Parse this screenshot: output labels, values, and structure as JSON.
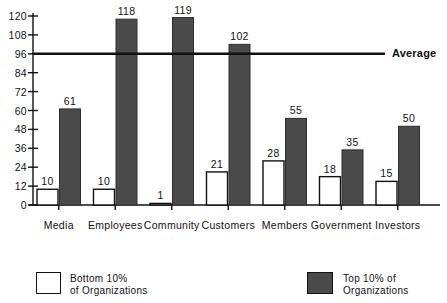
{
  "chart_data": {
    "type": "bar",
    "title": "",
    "subtitle": "",
    "xlabel": "",
    "ylabel": "",
    "ylim": [
      0,
      120
    ],
    "yticks": [
      0,
      12,
      24,
      36,
      48,
      60,
      72,
      84,
      96,
      108,
      120
    ],
    "grid": false,
    "legend_position": "bottom",
    "categories": [
      "Media",
      "Employees",
      "Community",
      "Customers",
      "Members",
      "Government",
      "Investors"
    ],
    "series": [
      {
        "name": "Bottom 10% of Organizations",
        "color": "#ffffff",
        "values": [
          10,
          10,
          1,
          21,
          28,
          18,
          15
        ]
      },
      {
        "name": "Top 10% of Organizations",
        "color": "#4a4a4a",
        "values": [
          61,
          118,
          119,
          102,
          55,
          35,
          50
        ]
      }
    ],
    "annotations": [
      {
        "name": "average-line",
        "label": "Average",
        "value": 96,
        "type": "horizontal-line"
      }
    ]
  },
  "legend": {
    "bottom": {
      "line1": "Bottom 10%",
      "line2": "of Organizations"
    },
    "top": {
      "line1": "Top 10% of",
      "line2": "Organizations"
    }
  },
  "axis": {
    "average_label": "Average"
  }
}
